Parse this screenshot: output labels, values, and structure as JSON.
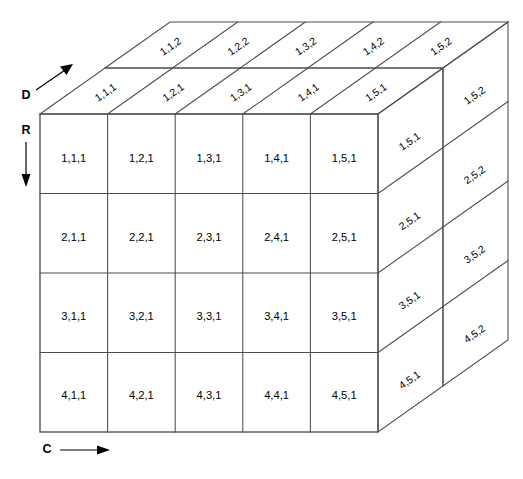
{
  "figure": {
    "caption": "",
    "stroke_color": "#4d4d4d",
    "text_color": "#000000",
    "background": "#ffffff"
  },
  "axes": [
    {
      "name": "depth-axis",
      "letter": "D",
      "direction": "up-right",
      "description": "Depth axis arrow pointing up and to the right"
    },
    {
      "name": "row-axis",
      "letter": "R",
      "direction": "down",
      "description": "Row axis arrow pointing down"
    },
    {
      "name": "column-axis",
      "letter": "C",
      "direction": "right",
      "description": "Column axis arrow pointing right"
    }
  ],
  "grid": {
    "rows": 4,
    "columns": 5,
    "depths": 2
  },
  "front_face": {
    "name": "front-face-depth-1",
    "rows": [
      [
        "1,1,1",
        "1,2,1",
        "1,3,1",
        "1,4,1",
        "1,5,1"
      ],
      [
        "2,1,1",
        "2,2,1",
        "2,3,1",
        "2,4,1",
        "2,5,1"
      ],
      [
        "3,1,1",
        "3,2,1",
        "3,3,1",
        "3,4,1",
        "3,5,1"
      ],
      [
        "4,1,1",
        "4,2,1",
        "4,3,1",
        "4,4,1",
        "4,5,1"
      ]
    ]
  },
  "top_face": {
    "name": "top-face",
    "front_row_labels": [
      "1,1,1",
      "1,2,1",
      "1,3,1",
      "1,4,1",
      "1,5,1"
    ],
    "back_row_labels": [
      "1,1,2",
      "1,2,2",
      "1,3,2",
      "1,4,2",
      "1,5,2"
    ]
  },
  "right_face": {
    "name": "right-side-faces",
    "near_panel_labels": [
      "1,5,1",
      "2,5,1",
      "3,5,1",
      "4,5,1"
    ],
    "far_panel_labels": [
      "1,5,2",
      "2,5,2",
      "3,5,2",
      "4,5,2"
    ]
  }
}
